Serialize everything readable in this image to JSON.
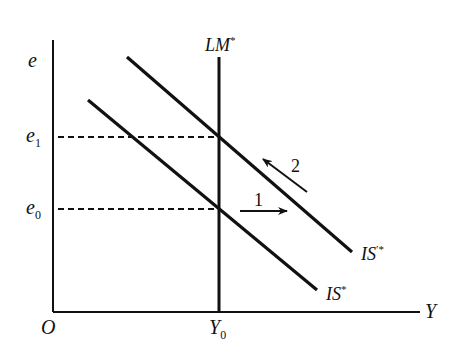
{
  "diagram": {
    "type": "IS-LM Mundell-Fleming diagram",
    "colors": {
      "line": "#111111",
      "background": "#ffffff"
    },
    "axes": {
      "y_label": "e",
      "x_label": "Y",
      "origin_label": "O"
    },
    "curves": {
      "lm": {
        "label": "LM",
        "superscript": "*"
      },
      "is": {
        "label": "IS",
        "superscript": "*"
      },
      "is_shifted": {
        "label": "IS",
        "superscript": "′*"
      }
    },
    "levels": {
      "e0": {
        "base": "e",
        "sub": "0"
      },
      "e1": {
        "base": "e",
        "sub": "1"
      },
      "y0": {
        "base": "Y",
        "sub": "0"
      }
    },
    "arrows": {
      "arrow1": {
        "label": "1",
        "direction": "right"
      },
      "arrow2": {
        "label": "2",
        "direction": "up-left"
      }
    }
  }
}
